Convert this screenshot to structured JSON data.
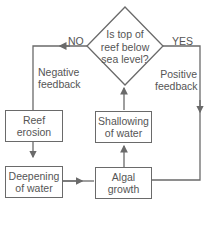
{
  "diagram": {
    "decision": {
      "text_lines": [
        "Is top of",
        "reef below",
        "sea level?"
      ]
    },
    "branches": {
      "no": "NO",
      "yes": "YES"
    },
    "feedback": {
      "negative_lines": [
        "Negative",
        "feedback"
      ],
      "positive_lines": [
        "Positive",
        "feedback"
      ]
    },
    "nodes": {
      "reef_erosion": [
        "Reef",
        "erosion"
      ],
      "deepening": [
        "Deepening",
        "of water"
      ],
      "algal_growth": [
        "Algal",
        "growth"
      ],
      "shallowing": [
        "Shallowing",
        "of water"
      ]
    },
    "colors": {
      "line": "#6a6a6a",
      "text": "#555555",
      "background": "#ffffff"
    }
  }
}
